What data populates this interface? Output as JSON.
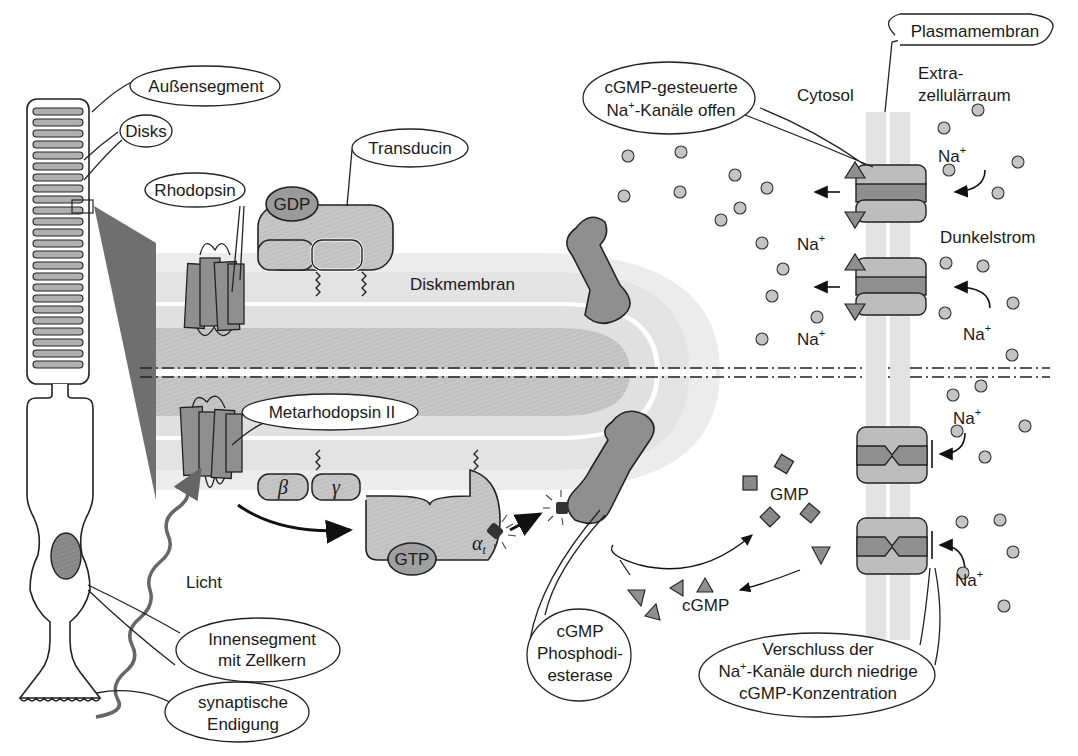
{
  "colors": {
    "background": "#ffffff",
    "membrane_light": "#e4e4e4",
    "membrane_mid": "#c8c8c8",
    "protein_gray": "#bdbdbd",
    "protein_dark": "#8a8a8a",
    "nucleus": "#7a7a7a",
    "outline": "#222222",
    "ion": "#c4c4c4"
  },
  "labels": {
    "aussensegment": "Außensegment",
    "disks": "Disks",
    "rhodopsin": "Rhodopsin",
    "transducin": "Transducin",
    "gdp": "GDP",
    "diskmembran": "Diskmembran",
    "metarhodopsin": "Metarhodopsin II",
    "beta": "β",
    "gamma": "γ",
    "gtp": "GTP",
    "alpha": "α",
    "alpha_sub": "t",
    "licht": "Licht",
    "innensegment_1": "Innensegment",
    "innensegment_2": "mit Zellkern",
    "synaptisch_1": "synaptische",
    "synaptisch_2": "Endigung",
    "pde_1": "cGMP",
    "pde_2": "Phosphodi-",
    "pde_3": "esterase",
    "gmp": "GMP",
    "cgmp": "cGMP",
    "plasmamembran": "Plasmamembran",
    "cytosol": "Cytosol",
    "extra_1": "Extra-",
    "extra_2": "zellulärraum",
    "channels_open_1": "cGMP-gesteuerte",
    "channels_open_2": "Na",
    "channels_open_2b": "-Kanäle offen",
    "dunkelstrom": "Dunkelstrom",
    "na": "Na",
    "plus": "+",
    "verschluss_1": "Verschluss der",
    "verschluss_2a": "Na",
    "verschluss_2b": "-Kanäle durch niedrige",
    "verschluss_3": "cGMP-Konzentration"
  },
  "na_labels": [
    {
      "x": 938,
      "y": 162
    },
    {
      "x": 797,
      "y": 250
    },
    {
      "x": 797,
      "y": 345
    },
    {
      "x": 963,
      "y": 340
    },
    {
      "x": 953,
      "y": 424
    },
    {
      "x": 955,
      "y": 586
    }
  ],
  "ions_top": [
    [
      628,
      156
    ],
    [
      681,
      152
    ],
    [
      735,
      175
    ],
    [
      624,
      196
    ],
    [
      680,
      192
    ],
    [
      721,
      220
    ],
    [
      740,
      208
    ],
    [
      767,
      188
    ],
    [
      944,
      128
    ],
    [
      978,
      110
    ],
    [
      949,
      170
    ],
    [
      1018,
      162
    ],
    [
      998,
      193
    ],
    [
      762,
      243
    ],
    [
      783,
      269
    ],
    [
      772,
      296
    ],
    [
      817,
      317
    ],
    [
      762,
      339
    ],
    [
      946,
      263
    ],
    [
      983,
      266
    ],
    [
      1013,
      303
    ],
    [
      945,
      313
    ],
    [
      1012,
      355
    ]
  ],
  "ions_bottom": [
    [
      953,
      395
    ],
    [
      981,
      386
    ],
    [
      957,
      431
    ],
    [
      1025,
      426
    ],
    [
      985,
      457
    ],
    [
      962,
      522
    ],
    [
      1000,
      520
    ],
    [
      1013,
      552
    ],
    [
      963,
      573
    ],
    [
      1004,
      606
    ]
  ]
}
